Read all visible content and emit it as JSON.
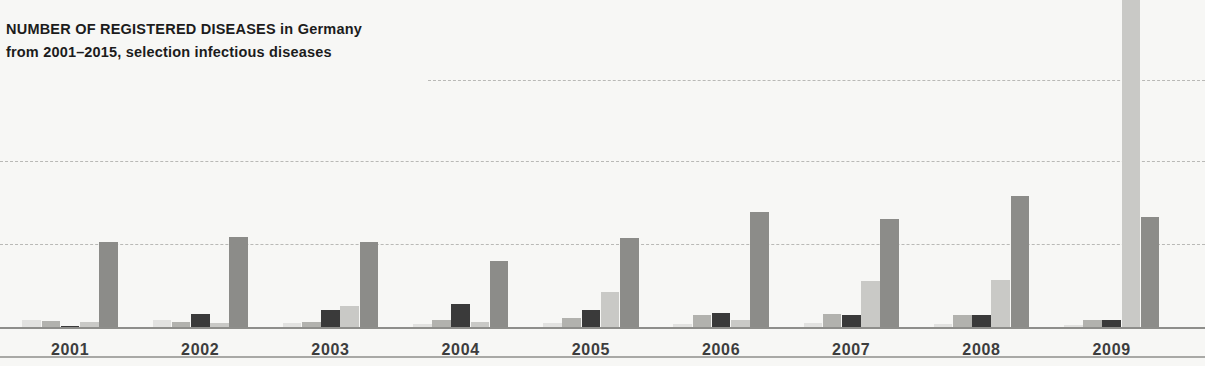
{
  "header": {
    "title_strong": "NUMBER OF REGISTERED DISEASES",
    "title_tail": " in Germany",
    "title_full": "NUMBER OF REGISTERED DISEASES in Germany",
    "subtitle": "from 2001–2015, selection infectious diseases"
  },
  "colors": {
    "background": "#f7f7f5",
    "gridline": "#b9b9b6",
    "baseline": "#8e8e8b",
    "bottom_rule": "#a9a9a6",
    "title_text": "#1c1c1c",
    "label_text": "#3d3d3d",
    "series": [
      "#e2e2e0",
      "#b2b2ae",
      "#3a3a3a",
      "#c9c9c6",
      "#8c8c89"
    ]
  },
  "chart_data": {
    "type": "bar",
    "title": "NUMBER OF REGISTERED DISEASES in Germany",
    "subtitle": "from 2001–2015, selection infectious diseases",
    "xlabel": "",
    "ylabel": "",
    "grid": true,
    "legend_position": "none",
    "grouping": "grouped",
    "ylim": [
      0,
      4
    ],
    "yticks": [
      1,
      2,
      3
    ],
    "ytick_labels": [
      "",
      "",
      ""
    ],
    "gridlines_y": [
      1,
      2,
      3
    ],
    "categories": [
      "2001",
      "2002",
      "2003",
      "2004",
      "2005",
      "2006",
      "2007",
      "2008",
      "2009"
    ],
    "series": [
      {
        "name": "series-1",
        "color": "#e2e2e0",
        "values": [
          0.09,
          0.09,
          0.05,
          0.04,
          0.05,
          0.04,
          0.05,
          0.04,
          0.03
        ]
      },
      {
        "name": "series-2",
        "color": "#b2b2ae",
        "values": [
          0.07,
          0.06,
          0.06,
          0.09,
          0.11,
          0.14,
          0.16,
          0.15,
          0.09
        ]
      },
      {
        "name": "series-3",
        "color": "#3a3a3a",
        "values": [
          0.01,
          0.16,
          0.2,
          0.28,
          0.21,
          0.17,
          0.14,
          0.14,
          0.09
        ]
      },
      {
        "name": "series-4",
        "color": "#c9c9c6",
        "values": [
          0.06,
          0.05,
          0.25,
          0.06,
          0.42,
          0.09,
          0.55,
          0.57,
          4.3
        ]
      },
      {
        "name": "series-5",
        "color": "#8c8c89",
        "values": [
          1.02,
          1.08,
          1.02,
          0.8,
          1.07,
          1.38,
          1.3,
          1.58,
          1.32
        ]
      }
    ]
  },
  "axis": {
    "tick_labels": [
      "2001",
      "2002",
      "2003",
      "2004",
      "2005",
      "2006",
      "2007",
      "2008",
      "2009"
    ]
  }
}
